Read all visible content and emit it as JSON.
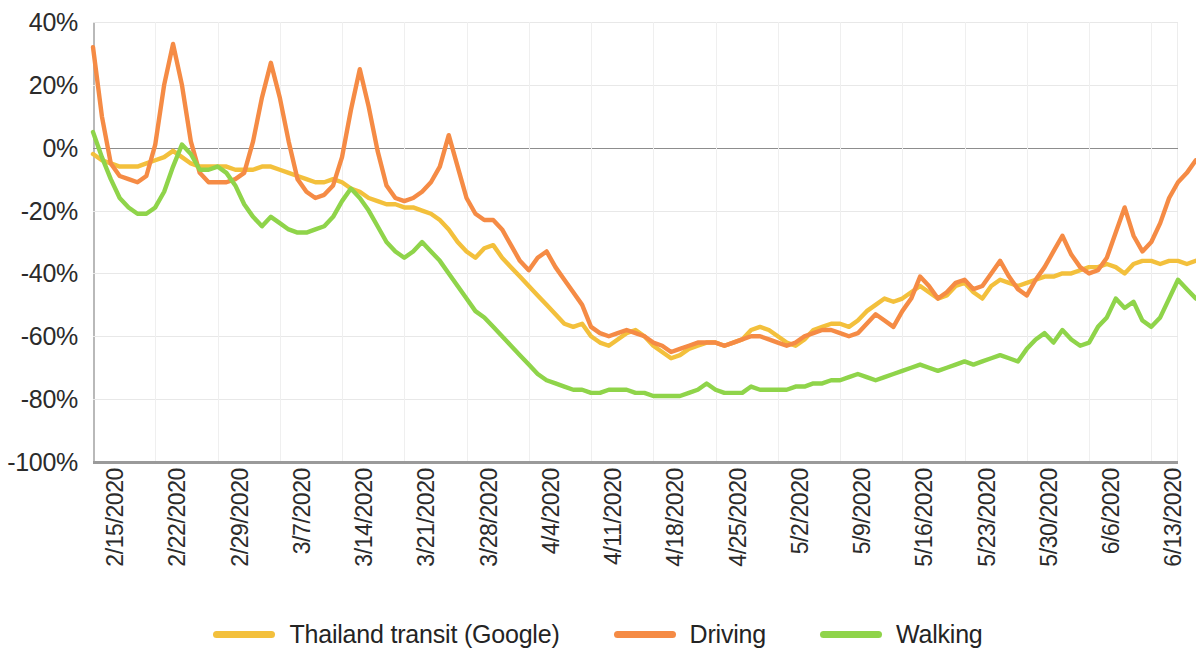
{
  "chart_data": {
    "type": "line",
    "title": "",
    "subtitle": "",
    "xlabel": "",
    "ylabel": "",
    "ylim": [
      -100,
      40
    ],
    "ytick_labels": [
      "40%",
      "20%",
      "0%",
      "-20%",
      "-40%",
      "-60%",
      "-80%",
      "-100%"
    ],
    "ytick_values": [
      40,
      20,
      0,
      -20,
      -40,
      -60,
      -80,
      -100
    ],
    "grid": true,
    "zero_line": true,
    "legend_position": "bottom",
    "x_tick_labels": [
      "2/15/2020",
      "2/22/2020",
      "2/29/2020",
      "3/7/2020",
      "3/14/2020",
      "3/21/2020",
      "3/28/2020",
      "4/4/2020",
      "4/11/2020",
      "4/18/2020",
      "4/25/2020",
      "5/2/2020",
      "5/9/2020",
      "5/16/2020",
      "5/23/2020",
      "5/30/2020",
      "6/6/2020",
      "6/13/2020"
    ],
    "x_tick_indices": [
      0,
      7,
      14,
      21,
      28,
      35,
      42,
      49,
      56,
      63,
      70,
      77,
      84,
      91,
      98,
      105,
      112,
      119
    ],
    "x_count": 123,
    "series": [
      {
        "name": "Thailand transit (Google)",
        "color": "#F3C03C",
        "values": [
          -2,
          -4,
          -5,
          -6,
          -6,
          -6,
          -5,
          -4,
          -3,
          -1,
          -3,
          -5,
          -6,
          -6,
          -6,
          -6,
          -7,
          -7,
          -7,
          -6,
          -6,
          -7,
          -8,
          -9,
          -10,
          -11,
          -11,
          -10,
          -11,
          -13,
          -14,
          -16,
          -17,
          -18,
          -18,
          -19,
          -19,
          -20,
          -21,
          -23,
          -26,
          -30,
          -33,
          -35,
          -32,
          -31,
          -35,
          -38,
          -41,
          -44,
          -47,
          -50,
          -53,
          -56,
          -57,
          -56,
          -60,
          -62,
          -63,
          -61,
          -59,
          -58,
          -60,
          -63,
          -65,
          -67,
          -66,
          -64,
          -63,
          -62,
          -62,
          -63,
          -62,
          -61,
          -58,
          -57,
          -58,
          -60,
          -62,
          -63,
          -61,
          -58,
          -57,
          -56,
          -56,
          -57,
          -55,
          -52,
          -50,
          -48,
          -49,
          -48,
          -46,
          -44,
          -46,
          -48,
          -47,
          -44,
          -43,
          -46,
          -48,
          -44,
          -42,
          -43,
          -44,
          -43,
          -42,
          -41,
          -41,
          -40,
          -40,
          -39,
          -38,
          -38,
          -37,
          -38,
          -40,
          -37,
          -36,
          -36,
          -37,
          -36,
          -36,
          -37,
          -36
        ]
      },
      {
        "name": "Driving",
        "color": "#F58B45",
        "values": [
          32,
          10,
          -5,
          -9,
          -10,
          -11,
          -9,
          1,
          20,
          33,
          20,
          2,
          -8,
          -11,
          -11,
          -11,
          -10,
          -8,
          2,
          16,
          27,
          16,
          2,
          -10,
          -14,
          -16,
          -15,
          -12,
          -3,
          12,
          25,
          13,
          -1,
          -12,
          -16,
          -17,
          -16,
          -14,
          -11,
          -6,
          4,
          -6,
          -16,
          -21,
          -23,
          -23,
          -26,
          -31,
          -36,
          -39,
          -35,
          -33,
          -38,
          -42,
          -46,
          -50,
          -57,
          -59,
          -60,
          -59,
          -58,
          -59,
          -60,
          -62,
          -63,
          -65,
          -64,
          -63,
          -62,
          -62,
          -62,
          -63,
          -62,
          -61,
          -60,
          -60,
          -61,
          -62,
          -63,
          -62,
          -60,
          -59,
          -58,
          -58,
          -59,
          -60,
          -59,
          -56,
          -53,
          -55,
          -57,
          -52,
          -48,
          -41,
          -44,
          -48,
          -46,
          -43,
          -42,
          -45,
          -44,
          -40,
          -36,
          -41,
          -45,
          -47,
          -42,
          -38,
          -33,
          -28,
          -34,
          -38,
          -40,
          -39,
          -35,
          -27,
          -19,
          -28,
          -33,
          -30,
          -24,
          -16,
          -11,
          -8,
          -4
        ]
      },
      {
        "name": "Walking",
        "color": "#8FD44A",
        "values": [
          5,
          -3,
          -10,
          -16,
          -19,
          -21,
          -21,
          -19,
          -14,
          -6,
          1,
          -2,
          -7,
          -7,
          -6,
          -8,
          -12,
          -18,
          -22,
          -25,
          -22,
          -24,
          -26,
          -27,
          -27,
          -26,
          -25,
          -22,
          -17,
          -13,
          -16,
          -20,
          -25,
          -30,
          -33,
          -35,
          -33,
          -30,
          -33,
          -36,
          -40,
          -44,
          -48,
          -52,
          -54,
          -57,
          -60,
          -63,
          -66,
          -69,
          -72,
          -74,
          -75,
          -76,
          -77,
          -77,
          -78,
          -78,
          -77,
          -77,
          -77,
          -78,
          -78,
          -79,
          -79,
          -79,
          -79,
          -78,
          -77,
          -75,
          -77,
          -78,
          -78,
          -78,
          -76,
          -77,
          -77,
          -77,
          -77,
          -76,
          -76,
          -75,
          -75,
          -74,
          -74,
          -73,
          -72,
          -73,
          -74,
          -73,
          -72,
          -71,
          -70,
          -69,
          -70,
          -71,
          -70,
          -69,
          -68,
          -69,
          -68,
          -67,
          -66,
          -67,
          -68,
          -64,
          -61,
          -59,
          -62,
          -58,
          -61,
          -63,
          -62,
          -57,
          -54,
          -48,
          -51,
          -49,
          -55,
          -57,
          -54,
          -48,
          -42,
          -45,
          -48
        ]
      }
    ],
    "legend": [
      {
        "label": "Thailand transit (Google)",
        "color": "#F3C03C"
      },
      {
        "label": "Driving",
        "color": "#F58B45"
      },
      {
        "label": "Walking",
        "color": "#8FD44A"
      }
    ]
  }
}
